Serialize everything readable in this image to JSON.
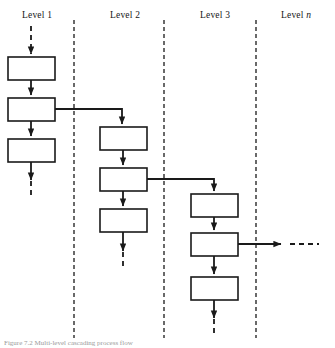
{
  "figure": {
    "title_visible": false,
    "caption": "Figure 7.2  Multi-level cascading process flow",
    "caption_truncated": true,
    "background": "#ffffff",
    "line_color": "#1a1a1a",
    "box_fill": "#ffffff"
  },
  "headers": [
    {
      "label": "Level 1",
      "prefix": "Level",
      "suffix": "1",
      "italic_suffix": false,
      "x": 36,
      "y": 12
    },
    {
      "label": "Level 2",
      "prefix": "Level",
      "suffix": "2",
      "italic_suffix": false,
      "x": 125,
      "y": 12
    },
    {
      "label": "Level 3",
      "prefix": "Level",
      "suffix": "3",
      "italic_suffix": false,
      "x": 215,
      "y": 12
    },
    {
      "label": "Level n",
      "prefix": "Level",
      "suffix": "n",
      "italic_suffix": true,
      "x": 297,
      "y": 12
    }
  ],
  "dividers": [
    {
      "name": "divider-1",
      "x": 74,
      "y1": 20,
      "y2": 338
    },
    {
      "name": "divider-2",
      "x": 164,
      "y1": 20,
      "y2": 338
    },
    {
      "name": "divider-3",
      "x": 256,
      "y1": 20,
      "y2": 338
    }
  ],
  "columns": [
    {
      "name": "level-1-column",
      "level": "Level 1",
      "center_x": 31,
      "boxes": [
        {
          "name": "level-1-box-1",
          "label": "",
          "x": 8,
          "y": 57,
          "w": 47,
          "h": 23
        },
        {
          "name": "level-1-box-2",
          "label": "",
          "x": 8,
          "y": 98,
          "w": 47,
          "h": 23
        },
        {
          "name": "level-1-box-3",
          "label": "",
          "x": 8,
          "y": 139,
          "w": 47,
          "h": 23
        }
      ],
      "entry": {
        "style": "dashed",
        "from_y": 26,
        "to_y": 57
      },
      "exit": {
        "style": "dashed",
        "from_y": 162,
        "to_y": 196
      },
      "branch": {
        "from_box": 2,
        "exit_y": 109,
        "to_x": 122,
        "to_column": "level-2-column"
      }
    },
    {
      "name": "level-2-column",
      "level": "Level 2",
      "center_x": 123,
      "boxes": [
        {
          "name": "level-2-box-1",
          "label": "",
          "x": 100,
          "y": 127,
          "w": 47,
          "h": 23
        },
        {
          "name": "level-2-box-2",
          "label": "",
          "x": 100,
          "y": 168,
          "w": 47,
          "h": 23
        },
        {
          "name": "level-2-box-3",
          "label": "",
          "x": 100,
          "y": 209,
          "w": 47,
          "h": 23
        }
      ],
      "entry": {
        "style": "solid",
        "from_y": 109,
        "to_y": 127
      },
      "exit": {
        "style": "dashed",
        "from_y": 232,
        "to_y": 268
      },
      "branch": {
        "from_box": 2,
        "exit_y": 179,
        "to_x": 214,
        "to_column": "level-3-column"
      }
    },
    {
      "name": "level-3-column",
      "level": "Level 3",
      "center_x": 214,
      "boxes": [
        {
          "name": "level-3-box-1",
          "label": "",
          "x": 191,
          "y": 194,
          "w": 47,
          "h": 23
        },
        {
          "name": "level-3-box-2",
          "label": "",
          "x": 191,
          "y": 233,
          "w": 47,
          "h": 23
        },
        {
          "name": "level-3-box-3",
          "label": "",
          "x": 191,
          "y": 277,
          "w": 47,
          "h": 23
        }
      ],
      "entry": {
        "style": "solid",
        "from_y": 179,
        "to_y": 194
      },
      "exit": {
        "style": "dashed",
        "from_y": 300,
        "to_y": 336
      },
      "branch": {
        "from_box": 2,
        "exit_y": 244,
        "to_x": 283,
        "to_column": "level-n-column"
      }
    },
    {
      "name": "level-n-column",
      "level": "Level n",
      "center_x": 300,
      "boxes": [],
      "continuation": {
        "style": "dashed",
        "from_x": 285,
        "to_x": 318,
        "y": 244
      }
    }
  ],
  "connectors": {
    "dash_pattern_entry": "5 4",
    "dash_pattern_divider": "4 3",
    "arrowhead": "solid-triangle"
  }
}
